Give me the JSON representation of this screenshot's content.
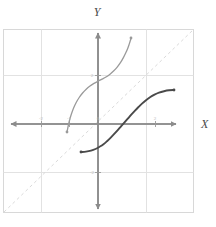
{
  "figure": {
    "kind": "coordinate-plane-graph",
    "background_color": "#ffffff",
    "plot_box": {
      "x": 3,
      "y": 29,
      "width": 191,
      "height": 184,
      "border_color": "#d8d8d8"
    }
  },
  "axes": {
    "x_title": "X",
    "y_title": "Y",
    "axis_color": "#8c8c8c",
    "grid_color": "#e2e2e2",
    "origin_px": {
      "x": 98,
      "y": 124
    },
    "unit_px": {
      "x": 28.5,
      "y": 24.5
    },
    "x_range": [
      -3.3,
      3.4
    ],
    "y_range": [
      -3.9,
      3.9
    ],
    "grid_on": true,
    "x_ticks": [
      {
        "value": -2,
        "label": "-2",
        "px_x": 41
      },
      {
        "value": -1,
        "label": "-1",
        "px_x": 69
      },
      {
        "value": 0,
        "label": "0",
        "px_x": 98
      },
      {
        "value": 2,
        "label": "2",
        "px_x": 155
      }
    ],
    "y_ticks": [
      {
        "value": 2,
        "label": "2",
        "px_y": 75
      },
      {
        "value": -2,
        "label": "-2",
        "px_y": 172
      }
    ],
    "x_gridlines_px": [
      41,
      146
    ],
    "y_gridlines_px": [
      75,
      172
    ]
  },
  "identity_line": {
    "name": "y = x reference line",
    "style": "dashed",
    "color": "#dadada",
    "dash": "3 3",
    "from_px": {
      "x": 4,
      "y": 212
    },
    "to_px": {
      "x": 193,
      "y": 30
    }
  },
  "chart_data": {
    "type": "line",
    "title": "",
    "xlabel": "X",
    "ylabel": "Y",
    "xlim": [
      -3.3,
      3.4
    ],
    "ylim": [
      -3.9,
      3.9
    ],
    "grid": true,
    "legend": "none",
    "annotations": [
      {
        "text": "y = x",
        "style": "dashed-diagonal-reference"
      }
    ],
    "series": [
      {
        "name": "inverse-function-curve",
        "color": "#9a9a9a",
        "width": 1.3,
        "endpoint_dots": true,
        "description": "Steeply increasing curve, reflection of the dark curve across y = x",
        "points_px": [
          [
            67.0,
            132.0
          ],
          [
            68.2,
            126.0
          ],
          [
            69.6,
            120.0
          ],
          [
            71.4,
            114.0
          ],
          [
            73.6,
            108.0
          ],
          [
            76.2,
            102.5
          ],
          [
            79.2,
            97.5
          ],
          [
            82.6,
            93.0
          ],
          [
            86.2,
            89.2
          ],
          [
            90.0,
            86.0
          ],
          [
            94.0,
            83.4
          ],
          [
            98.0,
            81.2
          ],
          [
            102.0,
            79.2
          ],
          [
            106.0,
            77.0
          ],
          [
            110.0,
            74.2
          ],
          [
            113.8,
            70.8
          ],
          [
            117.4,
            66.8
          ],
          [
            120.6,
            62.4
          ],
          [
            123.4,
            57.6
          ],
          [
            125.8,
            52.8
          ],
          [
            127.8,
            48.2
          ],
          [
            129.4,
            43.6
          ],
          [
            130.6,
            39.8
          ],
          [
            131.0,
            38.0
          ]
        ],
        "points_data": [
          [
            -1.09,
            -0.33
          ],
          [
            -1.05,
            0.08
          ],
          [
            -1.0,
            0.49
          ],
          [
            -0.94,
            0.82
          ],
          [
            -0.84,
            1.2
          ],
          [
            -0.77,
            1.53
          ],
          [
            -0.66,
            1.74
          ],
          [
            -0.54,
            1.84
          ],
          [
            -0.42,
            1.92
          ],
          [
            -0.28,
            1.96
          ],
          [
            -0.14,
            1.99
          ],
          [
            0.0,
            2.0
          ],
          [
            0.14,
            2.01
          ],
          [
            0.28,
            2.04
          ],
          [
            0.42,
            2.11
          ],
          [
            0.56,
            2.25
          ],
          [
            0.68,
            2.42
          ],
          [
            0.79,
            2.63
          ],
          [
            0.89,
            2.87
          ],
          [
            0.98,
            3.09
          ],
          [
            1.05,
            3.3
          ],
          [
            1.1,
            3.51
          ],
          [
            1.15,
            3.68
          ],
          [
            1.16,
            3.76
          ]
        ]
      },
      {
        "name": "main-function-curve",
        "color": "#4a4a4a",
        "width": 1.9,
        "endpoint_dots": true,
        "description": "S-shaped increasing curve passing near the origin",
        "points_px": [
          [
            81.0,
            152.0
          ],
          [
            86.0,
            151.6
          ],
          [
            91.0,
            150.6
          ],
          [
            95.5,
            149.0
          ],
          [
            99.5,
            146.8
          ],
          [
            103.5,
            144.2
          ],
          [
            107.0,
            141.2
          ],
          [
            110.5,
            137.8
          ],
          [
            114.0,
            134.2
          ],
          [
            117.5,
            130.4
          ],
          [
            121.0,
            126.4
          ],
          [
            124.5,
            122.4
          ],
          [
            128.0,
            118.4
          ],
          [
            131.5,
            114.4
          ],
          [
            135.0,
            110.6
          ],
          [
            138.5,
            107.0
          ],
          [
            142.0,
            103.6
          ],
          [
            146.0,
            100.2
          ],
          [
            150.0,
            97.2
          ],
          [
            154.5,
            94.6
          ],
          [
            159.0,
            92.6
          ],
          [
            164.0,
            91.2
          ],
          [
            169.0,
            90.3
          ],
          [
            174.0,
            90.0
          ]
        ],
        "points_data": [
          [
            -0.6,
            -1.14
          ],
          [
            -0.42,
            -1.13
          ],
          [
            -0.25,
            -1.09
          ],
          [
            -0.09,
            -1.02
          ],
          [
            0.05,
            -0.93
          ],
          [
            0.19,
            -0.82
          ],
          [
            0.32,
            -0.7
          ],
          [
            0.44,
            -0.56
          ],
          [
            0.56,
            -0.42
          ],
          [
            0.68,
            -0.26
          ],
          [
            0.81,
            -0.1
          ],
          [
            0.93,
            0.07
          ],
          [
            1.05,
            0.23
          ],
          [
            1.18,
            0.39
          ],
          [
            1.3,
            0.55
          ],
          [
            1.42,
            0.69
          ],
          [
            1.54,
            0.83
          ],
          [
            1.68,
            0.97
          ],
          [
            1.82,
            1.09
          ],
          [
            1.98,
            1.2
          ],
          [
            2.14,
            1.28
          ],
          [
            2.32,
            1.34
          ],
          [
            2.49,
            1.37
          ],
          [
            2.67,
            1.39
          ]
        ]
      }
    ]
  }
}
